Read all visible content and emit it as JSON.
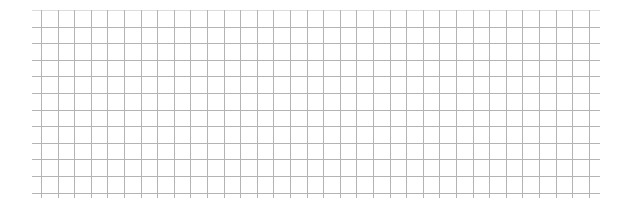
{
  "grid": {
    "x_start": 32,
    "x_end": 600,
    "first_vertical_x": 41,
    "vertical_count": 34,
    "y_top": 10,
    "y_bottom": 198,
    "first_horizontal_y": 10,
    "horizontal_count": 12,
    "spacing": 16.6,
    "line_color": "#b4b4b4",
    "top_line_color": "#dcdcdc"
  }
}
